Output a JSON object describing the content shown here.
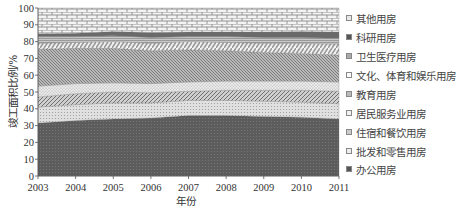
{
  "chart_data": {
    "type": "area",
    "stacked": true,
    "title": "",
    "xlabel": "年份",
    "ylabel": "竣工面积比例/%",
    "ylim": [
      0,
      100
    ],
    "yticks": [
      0,
      10,
      20,
      30,
      40,
      50,
      60,
      70,
      80,
      90,
      100
    ],
    "x": [
      2003,
      2004,
      2005,
      2006,
      2007,
      2008,
      2009,
      2010,
      2011
    ],
    "legend_position": "right",
    "grid": false,
    "series": [
      {
        "name": "办公用房",
        "values": [
          31.5,
          33.0,
          34.0,
          34.5,
          36.0,
          36.0,
          35.5,
          35.0,
          34.0
        ]
      },
      {
        "name": "批发和零售用房",
        "values": [
          9.5,
          9.5,
          9.5,
          9.0,
          9.0,
          9.0,
          9.0,
          9.0,
          9.0
        ]
      },
      {
        "name": "住宿和餐饮用房",
        "values": [
          6.0,
          6.5,
          6.5,
          6.0,
          5.5,
          6.0,
          6.5,
          7.0,
          7.5
        ]
      },
      {
        "name": "居民服务业用房",
        "values": [
          6.5,
          6.0,
          5.5,
          5.5,
          5.5,
          5.5,
          5.5,
          5.5,
          5.5
        ]
      },
      {
        "name": "教育用房",
        "values": [
          22.0,
          21.0,
          20.5,
          19.5,
          19.0,
          18.0,
          17.0,
          16.5,
          16.0
        ]
      },
      {
        "name": "文化、体育和娱乐用房",
        "values": [
          3.5,
          3.5,
          4.0,
          4.5,
          5.0,
          5.0,
          5.5,
          6.0,
          6.5
        ]
      },
      {
        "name": "卫生医疗用房",
        "values": [
          4.0,
          3.5,
          3.5,
          3.5,
          3.0,
          3.5,
          3.5,
          3.5,
          3.5
        ]
      },
      {
        "name": "科研用房",
        "values": [
          1.5,
          2.0,
          2.5,
          3.0,
          2.7,
          2.8,
          3.2,
          3.5,
          3.7
        ]
      },
      {
        "name": "其他用房",
        "values": [
          15.5,
          15.0,
          14.0,
          14.5,
          14.3,
          14.2,
          14.3,
          14.0,
          14.3
        ]
      }
    ]
  },
  "legend": {
    "items": [
      {
        "label": "其他用房",
        "pattern": "brick"
      },
      {
        "label": "科研用房",
        "pattern": "solid-dark"
      },
      {
        "label": "卫生医疗用房",
        "pattern": "horizontal-lines"
      },
      {
        "label": "文化、体育和娱乐用房",
        "pattern": "wave"
      },
      {
        "label": "教育用房",
        "pattern": "diagonal-dense"
      },
      {
        "label": "居民服务业用房",
        "pattern": "light-dots"
      },
      {
        "label": "住宿和餐饮用房",
        "pattern": "diagonal-medium"
      },
      {
        "label": "批发和零售用房",
        "pattern": "light-dots-2"
      },
      {
        "label": "办公用房",
        "pattern": "dark-dots"
      }
    ]
  },
  "axis": {
    "x_label": "年份",
    "y_label": "竣工面积比例/%"
  }
}
